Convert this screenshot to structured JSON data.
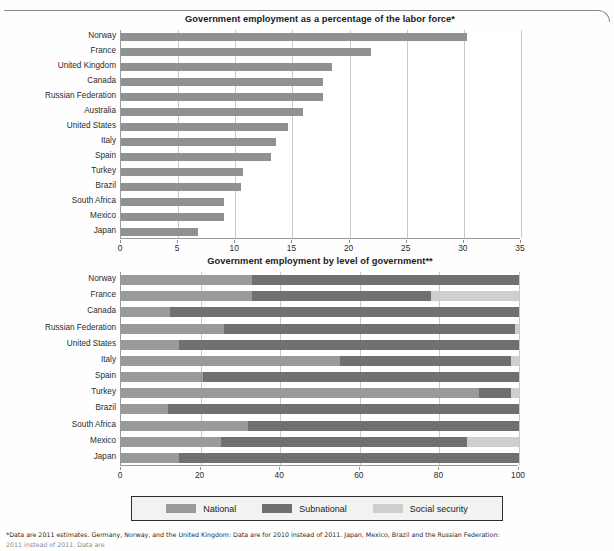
{
  "page": {
    "footnote_line1": "*Data are 2011 estimates. Germany, Norway, and the United Kingdom: Data are for 2010 instead of 2011. Japan, Mexico, Brazil and the Russian Federation:",
    "footnote_line2": "2011 instead of 2011. Data are"
  },
  "legend": {
    "items": [
      {
        "label": "National",
        "color": "#9a9a9a",
        "icon": "legend-swatch-national"
      },
      {
        "label": "Subnational",
        "color": "#707070",
        "icon": "legend-swatch-subnational"
      },
      {
        "label": "Social security",
        "color": "#cfcfcf",
        "icon": "legend-swatch-social-security"
      }
    ]
  },
  "chart_data": [
    {
      "id": "labor-force-share",
      "type": "bar",
      "orientation": "horizontal",
      "title": "Government employment as a percentage of the labor force*",
      "xlabel": "",
      "ylabel": "",
      "xlim": [
        0,
        35
      ],
      "xticks": [
        0,
        5,
        10,
        15,
        20,
        25,
        30,
        35
      ],
      "grid": true,
      "legend": "none",
      "series_color": "#919191",
      "categories": [
        "Norway",
        "France",
        "United Kingdom",
        "Canada",
        "Russian Federation",
        "Australia",
        "United States",
        "Italy",
        "Spain",
        "Turkey",
        "Brazil",
        "South Africa",
        "Mexico",
        "Japan"
      ],
      "values": [
        30.3,
        21.9,
        18.5,
        17.7,
        17.7,
        15.9,
        14.6,
        13.6,
        13.1,
        10.7,
        10.5,
        9.0,
        9.0,
        6.7
      ]
    },
    {
      "id": "level-of-government",
      "type": "bar",
      "orientation": "horizontal",
      "stacked": true,
      "title": "Government employment by level of government**",
      "xlabel": "",
      "ylabel": "",
      "xlim": [
        0,
        100
      ],
      "xticks": [
        0,
        20,
        40,
        60,
        80,
        100
      ],
      "grid": true,
      "legend": "bottom",
      "categories": [
        "Norway",
        "France",
        "Canada",
        "Russian Federation",
        "United States",
        "Italy",
        "Spain",
        "Turkey",
        "Brazil",
        "South Africa",
        "Mexico",
        "Japan"
      ],
      "series": [
        {
          "name": "National",
          "color": "#9a9a9a",
          "values": [
            33.0,
            33.0,
            12.3,
            26.0,
            14.5,
            55.0,
            20.5,
            90.0,
            11.8,
            32.0,
            25.0,
            14.5
          ]
        },
        {
          "name": "Subnational",
          "color": "#707070",
          "values": [
            67.0,
            45.0,
            87.7,
            73.0,
            85.5,
            43.0,
            79.5,
            8.0,
            88.2,
            68.0,
            62.0,
            85.5
          ]
        },
        {
          "name": "Social security",
          "color": "#cfcfcf",
          "values": [
            0.0,
            22.0,
            0.0,
            1.0,
            0.0,
            2.0,
            0.0,
            2.0,
            0.0,
            0.0,
            13.0,
            0.0
          ]
        }
      ]
    }
  ]
}
